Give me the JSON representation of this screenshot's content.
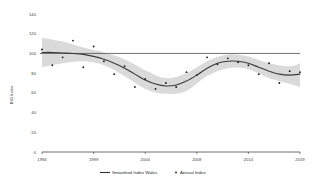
{
  "chart_data": {
    "type": "line",
    "title": "",
    "xlabel": "",
    "ylabel": "BIG Index",
    "xlim": [
      1994,
      2019
    ],
    "ylim": [
      0,
      140
    ],
    "grid": false,
    "legend_position": "bottom",
    "x_ticks": [
      "1994",
      "1999",
      "2004",
      "2009",
      "2014",
      "2019"
    ],
    "x_tick_values": [
      1994,
      1999,
      2004,
      2009,
      2014,
      2019
    ],
    "y_ticks": [
      "0",
      "20",
      "40",
      "60",
      "80",
      "100",
      "120",
      "140"
    ],
    "y_tick_values": [
      0,
      20,
      40,
      60,
      80,
      100,
      120,
      140
    ],
    "reference_line": {
      "value": 100,
      "color": "#4d4d4d"
    },
    "series": [
      {
        "name": "Smoothed Index Wales",
        "type": "line",
        "color": "#3a3a3a",
        "x": [
          1994,
          1995,
          1996,
          1997,
          1998,
          1999,
          2000,
          2001,
          2002,
          2003,
          2004,
          2005,
          2006,
          2007,
          2008,
          2009,
          2010,
          2011,
          2012,
          2013,
          2014,
          2015,
          2016,
          2017,
          2018,
          2019
        ],
        "values": [
          101,
          101,
          100.5,
          100,
          99,
          97,
          94,
          90,
          85,
          79,
          73,
          69,
          67,
          68,
          72,
          78,
          85,
          90,
          92,
          92,
          90,
          86,
          82,
          79,
          78,
          79
        ]
      },
      {
        "name": "Annual Index",
        "type": "scatter",
        "color": "#1f1f1f",
        "x": [
          1994,
          1995,
          1996,
          1997,
          1998,
          1999,
          2000,
          2001,
          2002,
          2003,
          2004,
          2005,
          2006,
          2007,
          2008,
          2009,
          2010,
          2011,
          2012,
          2013,
          2014,
          2015,
          2016,
          2017,
          2018,
          2019
        ],
        "values": [
          104,
          88,
          96,
          113,
          86,
          107,
          92,
          79,
          87,
          66,
          74,
          64,
          70,
          66,
          81,
          78,
          96,
          89,
          95,
          91,
          88,
          79,
          90,
          70,
          82,
          81
        ]
      }
    ],
    "confidence_band": {
      "name": "Smoothed Index Wales CI",
      "color": "#d4d4d4",
      "x": [
        1994,
        1996,
        1998,
        2000,
        2002,
        2004,
        2006,
        2008,
        2010,
        2012,
        2014,
        2016,
        2018,
        2019
      ],
      "upper": [
        116,
        112,
        106,
        101,
        94,
        83,
        75,
        80,
        92,
        99,
        97,
        90,
        87,
        90
      ],
      "lower": [
        86,
        90,
        92,
        88,
        77,
        64,
        59,
        62,
        77,
        85,
        84,
        75,
        69,
        66
      ]
    }
  },
  "legend": {
    "items": [
      {
        "label": "Smoothed Index Wales",
        "marker": "line",
        "color": "#3a3a3a"
      },
      {
        "label": "Annual Index",
        "marker": "dot",
        "color": "#1f1f1f"
      }
    ]
  }
}
